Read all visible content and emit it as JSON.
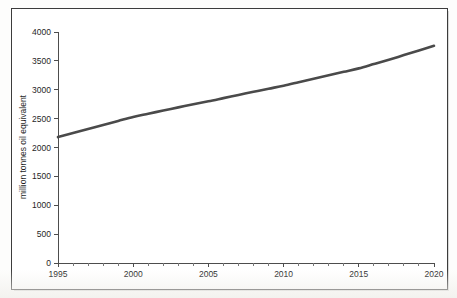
{
  "figure": {
    "title_remnant": "",
    "frame_color": "#3c3c3c",
    "background_color": "#ffffff"
  },
  "chart_data": {
    "type": "line",
    "title": "",
    "subtitle": "",
    "xlabel": "",
    "ylabel": "million tonnes oil equivalent",
    "xlim": [
      1995,
      2020
    ],
    "ylim": [
      0,
      4000
    ],
    "grid": false,
    "legend": false,
    "legend_position": "none",
    "line_color": "#4a4a4a",
    "line_width": 2.6,
    "x_ticks": [
      1995,
      2000,
      2005,
      2010,
      2015,
      2020
    ],
    "x_tick_labels": [
      "1995",
      "2000",
      "2005",
      "2010",
      "2015",
      "2020"
    ],
    "x_minor_tick_step": 1,
    "y_ticks": [
      0,
      500,
      1000,
      1500,
      2000,
      2500,
      3000,
      3500,
      4000
    ],
    "y_tick_labels": [
      "0",
      "500",
      "1000",
      "1500",
      "2000",
      "2500",
      "3000",
      "3500",
      "4000"
    ],
    "x": [
      1995,
      1996,
      1997,
      1998,
      1999,
      2000,
      2001,
      2002,
      2003,
      2004,
      2005,
      2006,
      2007,
      2008,
      2009,
      2010,
      2011,
      2012,
      2013,
      2014,
      2015,
      2016,
      2017,
      2018,
      2019,
      2020
    ],
    "series": [
      {
        "name": "world energy demand",
        "values": [
          2180,
          2250,
          2320,
          2390,
          2460,
          2530,
          2585,
          2640,
          2695,
          2750,
          2800,
          2855,
          2910,
          2965,
          3018,
          3070,
          3130,
          3190,
          3250,
          3310,
          3370,
          3445,
          3520,
          3600,
          3680,
          3760
        ]
      }
    ]
  }
}
